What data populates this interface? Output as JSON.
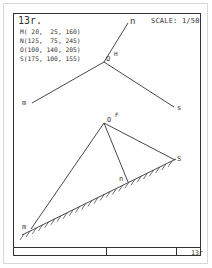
{
  "drawing": {
    "title": "13r.",
    "scale_label": "SCALE: 1/50",
    "coordinates": [
      {
        "point": "M",
        "text": "M( 20,  25, 160)"
      },
      {
        "point": "N",
        "text": "N(125,  75, 245)"
      },
      {
        "point": "O",
        "text": "O(100, 140, 205)"
      },
      {
        "point": "S",
        "text": "S(175, 100, 155)"
      }
    ],
    "upper_figure": {
      "labels": {
        "n": "n",
        "m": "m",
        "s": "s",
        "o": "O",
        "o_sup": "H"
      }
    },
    "lower_figure": {
      "labels": {
        "o": "O",
        "o_sup": "F",
        "s": "S",
        "n": "n",
        "m": "m"
      }
    },
    "title_block": {
      "sheet_code": "13r"
    }
  }
}
